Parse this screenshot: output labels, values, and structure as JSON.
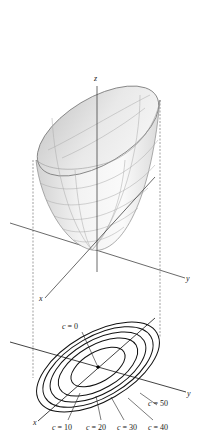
{
  "figure": {
    "type": "elliptic paraboloid with level curves",
    "axes": {
      "x_label": "x",
      "y_label": "y",
      "z_label": "z"
    },
    "surface": {
      "description": "paraboloid surface opening upward"
    },
    "contour_plot": {
      "center_label": "c = 0",
      "levels": [
        {
          "label": "c = 10",
          "value": 10
        },
        {
          "label": "c = 20",
          "value": 20
        },
        {
          "label": "c = 30",
          "value": 30
        },
        {
          "label": "c = 40",
          "value": 40
        },
        {
          "label": "c = 50",
          "value": 50
        }
      ],
      "x_label": "x",
      "y_label": "y"
    },
    "colors": {
      "ink": "#222222",
      "surface_light": "#f4f4f4",
      "surface_dark": "#cfcfcf",
      "grid": "#9a9a9a"
    }
  }
}
